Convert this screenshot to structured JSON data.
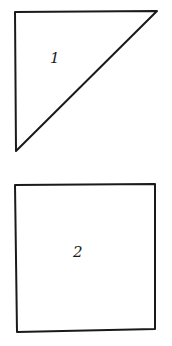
{
  "shapes": [
    {
      "type": "triangle",
      "label": "1",
      "points": [
        [
          15,
          12
        ],
        [
          157,
          11
        ],
        [
          16,
          151
        ]
      ],
      "label_pos": [
        51,
        49
      ]
    },
    {
      "type": "square",
      "label": "2",
      "points": [
        [
          15,
          185
        ],
        [
          155,
          184
        ],
        [
          155,
          329
        ],
        [
          17,
          332
        ]
      ],
      "label_pos": [
        73,
        243
      ]
    }
  ],
  "colors": {
    "stroke": "#1a1a1a",
    "background": "#ffffff"
  }
}
